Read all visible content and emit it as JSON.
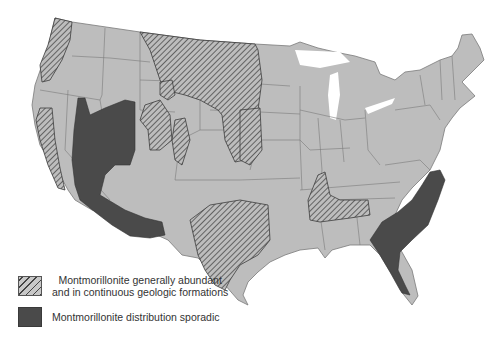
{
  "map": {
    "subject": "Montmorillonite distribution in the contiguous United States",
    "colors": {
      "land": "#bdbdbd",
      "state_border": "#7a7a7a",
      "hatch_line": "#3c3c3c",
      "sporadic": "#4a4a4a",
      "water": "#ffffff"
    }
  },
  "legend": {
    "items": [
      {
        "key": "abundant",
        "pattern": "hatched",
        "line1": "Montmorillonite generally abundant",
        "line2": "and in continuous geologic formations"
      },
      {
        "key": "sporadic",
        "pattern": "solid-dark",
        "line1": "Montmorillonite distribution sporadic"
      }
    ]
  }
}
